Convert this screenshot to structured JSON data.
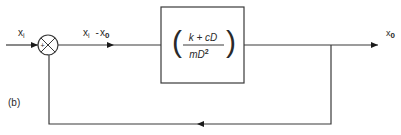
{
  "figure": {
    "panel_label": "(b)",
    "type": "block-diagram"
  },
  "input": {
    "label_main": "x",
    "label_sub": "i"
  },
  "summing_junction": {
    "plus_sign": "+",
    "minus_sign": "-"
  },
  "error_signal": {
    "label_a_main": "x",
    "label_a_sub": "i",
    "operator": "-",
    "label_b_main": "x",
    "label_b_sub": "0"
  },
  "transfer_block": {
    "numerator": "k + cD",
    "denominator_main": "mD",
    "denominator_exp": "2",
    "left_paren": "(",
    "right_paren": ")"
  },
  "output": {
    "label_main": "x",
    "label_sub": "0"
  },
  "colors": {
    "line": "#3a3a3a",
    "text": "#2a2a2a",
    "background": "#ffffff"
  }
}
